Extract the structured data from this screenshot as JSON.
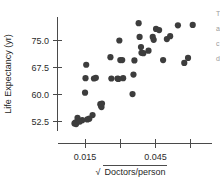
{
  "chart_data": {
    "type": "scatter",
    "title": "",
    "xlabel": "√Doctors/person",
    "ylabel": "Life Expectancy (yr)",
    "xlabel_radicand": "Doctors/person",
    "xlabel_radical_symbol": "√",
    "xlim": [
      0.0035,
      0.069
    ],
    "ylim": [
      50.0,
      81.5
    ],
    "grid": false,
    "legend": null,
    "x_ticks": [
      0.015,
      0.03,
      0.045,
      0.06
    ],
    "x_tick_labels": [
      "0.015",
      "",
      "0.045",
      ""
    ],
    "y_ticks": [
      52.5,
      60.0,
      67.5,
      75.0
    ],
    "y_tick_labels": [
      "52.5",
      "60.0",
      "67.5",
      "75.0"
    ],
    "marker": "filled-circle",
    "marker_color": "#3d3d3d",
    "marker_size": 3.1,
    "n_points": 46,
    "points": [
      {
        "x": 0.0105,
        "y": 52.1
      },
      {
        "x": 0.011,
        "y": 52.4
      },
      {
        "x": 0.0112,
        "y": 51.9
      },
      {
        "x": 0.0118,
        "y": 53.6
      },
      {
        "x": 0.0138,
        "y": 53.0
      },
      {
        "x": 0.015,
        "y": 60.6
      },
      {
        "x": 0.0152,
        "y": 64.6
      },
      {
        "x": 0.0155,
        "y": 68.3
      },
      {
        "x": 0.0168,
        "y": 53.4
      },
      {
        "x": 0.0182,
        "y": 54.4
      },
      {
        "x": 0.0188,
        "y": 64.5
      },
      {
        "x": 0.0196,
        "y": 64.7
      },
      {
        "x": 0.0215,
        "y": 57.4
      },
      {
        "x": 0.0218,
        "y": 57.0
      },
      {
        "x": 0.022,
        "y": 56.6
      },
      {
        "x": 0.0258,
        "y": 70.4
      },
      {
        "x": 0.0262,
        "y": 64.5
      },
      {
        "x": 0.0288,
        "y": 64.5
      },
      {
        "x": 0.0296,
        "y": 75.0
      },
      {
        "x": 0.03,
        "y": 69.6
      },
      {
        "x": 0.0308,
        "y": 69.6
      },
      {
        "x": 0.0312,
        "y": 64.6
      },
      {
        "x": 0.0352,
        "y": 60.2
      },
      {
        "x": 0.0356,
        "y": 65.6
      },
      {
        "x": 0.036,
        "y": 69.5
      },
      {
        "x": 0.0378,
        "y": 79.8
      },
      {
        "x": 0.0382,
        "y": 76.0
      },
      {
        "x": 0.0388,
        "y": 73.2
      },
      {
        "x": 0.039,
        "y": 71.6
      },
      {
        "x": 0.0398,
        "y": 71.5
      },
      {
        "x": 0.042,
        "y": 72.2
      },
      {
        "x": 0.0438,
        "y": 76.0
      },
      {
        "x": 0.0442,
        "y": 75.2
      },
      {
        "x": 0.0452,
        "y": 78.2
      },
      {
        "x": 0.0465,
        "y": 77.9
      },
      {
        "x": 0.0482,
        "y": 69.6
      },
      {
        "x": 0.0498,
        "y": 75.4
      },
      {
        "x": 0.0512,
        "y": 76.2
      },
      {
        "x": 0.0545,
        "y": 79.2
      },
      {
        "x": 0.0572,
        "y": 68.8
      },
      {
        "x": 0.0588,
        "y": 70.2
      },
      {
        "x": 0.0608,
        "y": 79.3
      },
      {
        "x": 0.0128,
        "y": 52.6
      },
      {
        "x": 0.016,
        "y": 53.2
      },
      {
        "x": 0.0222,
        "y": 57.6
      },
      {
        "x": 0.0292,
        "y": 64.4
      }
    ]
  },
  "edge_text": [
    "T",
    "a",
    "c",
    "d"
  ]
}
